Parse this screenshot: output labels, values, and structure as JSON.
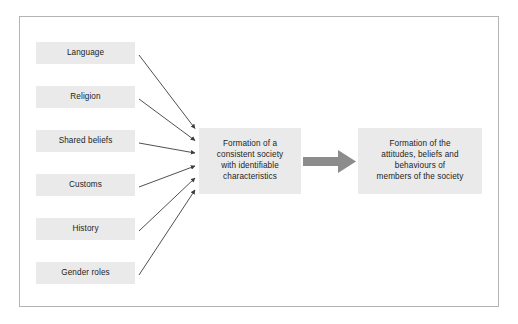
{
  "diagram": {
    "type": "flow-diagram",
    "background_color": "#ffffff",
    "frame_border_color": "#b4b4b4",
    "node_fill_color": "#eaeaea",
    "node_text_color": "#1d1d1d",
    "thin_arrow_color": "#3c3c3c",
    "block_arrow_color": "#8c8c8c",
    "sources": [
      {
        "id": "language",
        "label": "Language"
      },
      {
        "id": "religion",
        "label": "Religion"
      },
      {
        "id": "shared-beliefs",
        "label": "Shared beliefs"
      },
      {
        "id": "customs",
        "label": "Customs"
      },
      {
        "id": "history",
        "label": "History"
      },
      {
        "id": "gender-roles",
        "label": "Gender roles"
      }
    ],
    "center": {
      "id": "consistent-society",
      "label": "Formation of a\nconsistent society\nwith identifiable\ncharacteristics"
    },
    "outcome": {
      "id": "members-attitudes",
      "label": "Formation of the\nattitudes, beliefs and\nbehaviours of\nmembers of the society"
    },
    "connectors": {
      "source_to_center_count": 6,
      "center_to_outcome": "block-arrow-right"
    }
  }
}
